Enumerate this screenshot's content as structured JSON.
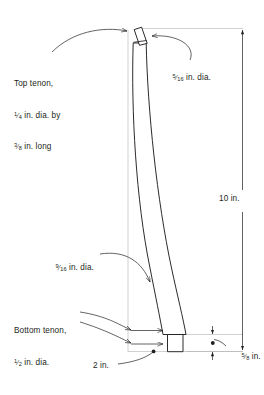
{
  "drawing": {
    "title": "Curved leg with tenons",
    "line_color": "#231f20",
    "thin_line_color": "#a7a9ac",
    "text_color": "#231f20",
    "background": "#ffffff"
  },
  "annotations": {
    "top_tenon": {
      "line1": "Top tenon,",
      "line2_num": "1",
      "line2_den": "4",
      "line2_rest": " in. dia. by",
      "line3_num": "3",
      "line3_den": "8",
      "line3_rest": " in. long",
      "icon": "leader-arrow-icon"
    },
    "upper_diameter": {
      "num": "5",
      "den": "16",
      "rest": " in. dia.",
      "icon": "leader-arrow-icon"
    },
    "mid_diameter": {
      "num": "9",
      "den": "16",
      "rest": " in. dia.",
      "icon": "leader-arrow-icon"
    },
    "bottom_tenon": {
      "line1": "Bottom tenon,",
      "line2_num": "1",
      "line2_den": "2",
      "line2_rest": " in. dia.",
      "icon": "leader-arrow-icon"
    },
    "height_dimension": {
      "text": "10 in.",
      "icon": "vertical-dimension-icon"
    },
    "width_dimension": {
      "text": "2 in.",
      "icon": "leader-dot-icon"
    },
    "thickness_dimension": {
      "num": "5",
      "den": "8",
      "rest": " in.",
      "icon": "vertical-dimension-icon"
    }
  }
}
